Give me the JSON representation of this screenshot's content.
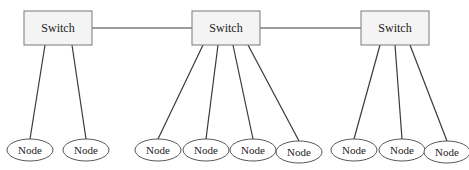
{
  "diagram": {
    "type": "network-topology",
    "switches": [
      {
        "id": "s1",
        "label": "Switch",
        "x": 24,
        "y": 11,
        "w": 68,
        "h": 34
      },
      {
        "id": "s2",
        "label": "Switch",
        "x": 192,
        "y": 11,
        "w": 68,
        "h": 34
      },
      {
        "id": "s3",
        "label": "Switch",
        "x": 361,
        "y": 11,
        "w": 68,
        "h": 34
      }
    ],
    "trunk_links": [
      {
        "from": "s1",
        "to": "s2"
      },
      {
        "from": "s2",
        "to": "s3"
      }
    ],
    "nodes": [
      {
        "id": "n1",
        "label": "Node",
        "switch": "s1",
        "cx": 30,
        "cy": 150,
        "ax": 45
      },
      {
        "id": "n2",
        "label": "Node",
        "switch": "s1",
        "cx": 86,
        "cy": 150,
        "ax": 72
      },
      {
        "id": "n3",
        "label": "Node",
        "switch": "s2",
        "cx": 158,
        "cy": 150,
        "ax": 203
      },
      {
        "id": "n4",
        "label": "Node",
        "switch": "s2",
        "cx": 206,
        "cy": 150,
        "ax": 218
      },
      {
        "id": "n5",
        "label": "Node",
        "switch": "s2",
        "cx": 253,
        "cy": 150,
        "ax": 233
      },
      {
        "id": "n6",
        "label": "Node",
        "switch": "s2",
        "cx": 299,
        "cy": 152,
        "ax": 248
      },
      {
        "id": "n7",
        "label": "Node",
        "switch": "s3",
        "cx": 354,
        "cy": 150,
        "ax": 380
      },
      {
        "id": "n8",
        "label": "Node",
        "switch": "s3",
        "cx": 402,
        "cy": 150,
        "ax": 395
      },
      {
        "id": "n9",
        "label": "Node",
        "switch": "s3",
        "cx": 447,
        "cy": 152,
        "ax": 410
      }
    ],
    "colors": {
      "line": "#3a3a3a",
      "switch_fill": "#f4f4f4",
      "switch_stroke": "#7a7a7a",
      "node_stroke": "#555555"
    }
  }
}
